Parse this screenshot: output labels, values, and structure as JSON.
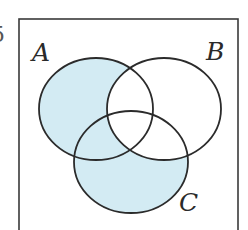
{
  "figure": {
    "question_number_fragment": "5",
    "universal_set_frame": {
      "left": 19,
      "top": 19,
      "right": 238,
      "bottom": 240,
      "stroke": "#3a3a3a"
    },
    "sets": [
      {
        "id": "A",
        "label": "A",
        "cx": 96,
        "cy": 109,
        "rx": 57,
        "ry": 51
      },
      {
        "id": "B",
        "label": "B",
        "cx": 164,
        "cy": 109,
        "rx": 57,
        "ry": 51
      },
      {
        "id": "C",
        "label": "C",
        "cx": 131,
        "cy": 162,
        "rx": 57,
        "ry": 51
      }
    ],
    "shaded_region": "(A ∪ C) \\ B",
    "colors": {
      "shade": "#d3ebf3",
      "outline": "#2b2b2b",
      "background": "#ffffff"
    }
  }
}
